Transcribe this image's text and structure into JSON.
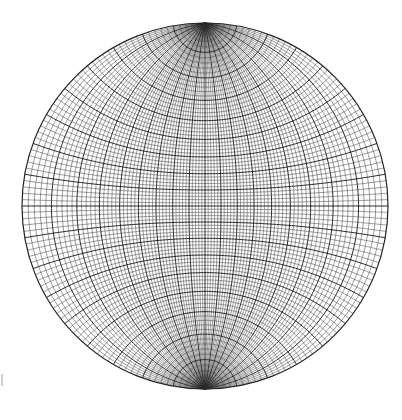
{
  "diagram": {
    "type": "wulff-stereonet",
    "center": [
      205,
      206
    ],
    "radius": 183,
    "minor_interval_deg": 2,
    "major_interval_deg": 10,
    "line_color": "#3a3a3a",
    "major_line_color": "#111111",
    "background": "#ffffff",
    "primitive_circle": true,
    "polar_caps": "north and south poles show small-circle fan with radial lines"
  }
}
